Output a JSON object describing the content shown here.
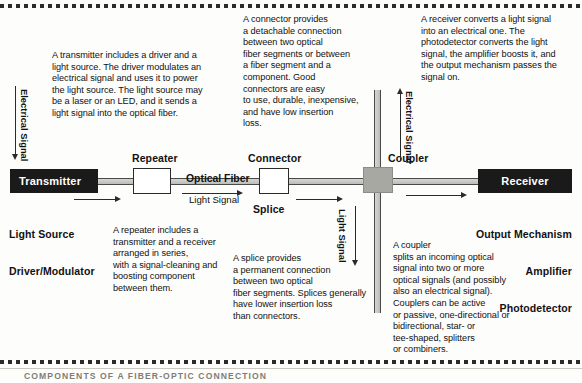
{
  "figure": {
    "caption": "COMPONENTS OF A FIBER-OPTIC CONNECTION"
  },
  "notes": {
    "transmitter": [
      "A transmitter includes a driver and a",
      "light source. The driver modulates an",
      "electrical signal and uses it to power",
      "the light source. The light source may",
      "be a laser or an LED, and it sends a",
      "light signal into the optical fiber."
    ],
    "connector": [
      "A connector provides",
      "a detachable connection",
      "between two optical",
      "fiber segments or between",
      "a fiber segment and a",
      "component. Good",
      "connectors are easy",
      "to use, durable, inexpensive,",
      "and have low insertion",
      "loss."
    ],
    "receiver": [
      "A receiver converts a light signal",
      "into an electrical one. The",
      "photodetector converts the light",
      "signal, the amplifier boosts it, and",
      "the output mechanism passes the",
      "signal on."
    ],
    "repeater": [
      "A repeater includes a",
      "transmitter and a receiver",
      "arranged in series,",
      "with a signal-cleaning and",
      "boosting component",
      "between them."
    ],
    "splice": [
      "A splice provides",
      "a permanent connection",
      "between two optical",
      "fiber segments. Splices generally",
      "have lower insertion loss",
      "than connectors."
    ],
    "coupler": [
      "A coupler",
      "splits an incoming optical",
      "signal into two or more",
      "optical signals (and possibly",
      "also an electrical signal).",
      "Couplers can be active",
      "or passive, one-directional or",
      "bidirectional, star- or",
      "tee-shaped, splitters",
      "or combiners."
    ]
  },
  "components": {
    "transmitter_label": "Transmitter",
    "receiver_label": "Receiver",
    "repeater_label": "Repeater",
    "connector_label": "Connector",
    "splice_label": "Splice",
    "coupler_label": "Coupler",
    "optical_fiber_label": "Optical Fiber"
  },
  "annotations": {
    "transmitter_side": [
      "Light Source",
      "Driver/Modulator"
    ],
    "receiver_side": [
      "Output Mechanism",
      "Amplifier",
      "Photodetector"
    ]
  },
  "signals": {
    "electrical_in": "Electrical Signal",
    "electrical_up": "Electrical Signal",
    "light_main": "Light Signal",
    "light_down": "Light Signal"
  },
  "colors": {
    "component_black": "#1a1a1a",
    "fiber_gray": "#bdbdb7",
    "coupler_gray": "#a8a8a2",
    "ink": "#111111",
    "caption_gray": "#7d7d76"
  }
}
